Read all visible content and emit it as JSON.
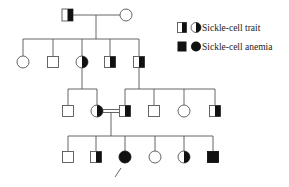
{
  "colors": {
    "line": "#555555",
    "fill": "#111111",
    "background": "#ffffff"
  },
  "legend": {
    "items": [
      {
        "label": "Sickle-cell trait",
        "symbol": "half-filled"
      },
      {
        "label": "Sickle-cell anemia",
        "symbol": "filled"
      }
    ]
  },
  "pedigree": {
    "generations": [
      {
        "id": "I",
        "members": [
          {
            "sex": "male",
            "status": "trait"
          },
          {
            "sex": "female",
            "status": "unaffected"
          }
        ]
      },
      {
        "id": "II",
        "members": [
          {
            "sex": "female",
            "status": "unaffected"
          },
          {
            "sex": "male",
            "status": "unaffected"
          },
          {
            "sex": "female",
            "status": "trait"
          },
          {
            "sex": "male",
            "status": "trait"
          },
          {
            "sex": "male",
            "status": "trait"
          }
        ]
      },
      {
        "id": "III",
        "members": [
          {
            "sex": "male",
            "status": "unaffected"
          },
          {
            "sex": "female",
            "status": "trait"
          },
          {
            "sex": "male",
            "status": "trait"
          },
          {
            "sex": "male",
            "status": "unaffected"
          },
          {
            "sex": "female",
            "status": "unaffected"
          },
          {
            "sex": "male",
            "status": "trait"
          }
        ]
      },
      {
        "id": "IV",
        "members": [
          {
            "sex": "male",
            "status": "unaffected"
          },
          {
            "sex": "male",
            "status": "trait"
          },
          {
            "sex": "female",
            "status": "anemia",
            "proband": true
          },
          {
            "sex": "female",
            "status": "unaffected"
          },
          {
            "sex": "female",
            "status": "trait"
          },
          {
            "sex": "male",
            "status": "anemia"
          }
        ]
      }
    ],
    "consanguineous_mating": "III-2 x III-3",
    "proband": "IV-3"
  }
}
